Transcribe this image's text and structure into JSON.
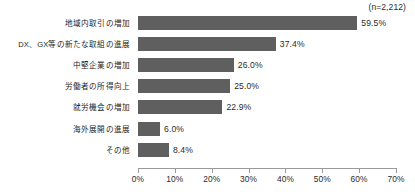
{
  "chart_data": {
    "type": "bar",
    "orientation": "horizontal",
    "title": "",
    "subtitle": "",
    "xlabel": "",
    "ylabel": "",
    "annotation": "(n=2,212)",
    "grid": false,
    "legend": false,
    "xlim": [
      0,
      70
    ],
    "xtick_labels": [
      "0%",
      "10%",
      "20%",
      "30%",
      "40%",
      "50%",
      "60%",
      "70%"
    ],
    "xticks": [
      0,
      10,
      20,
      30,
      40,
      50,
      60,
      70
    ],
    "bar_color": "#5f5f5f",
    "axis_color": "#9a9a9a",
    "categories": [
      "地域内取引の増加",
      "DX、GX等の新たな取組の進展",
      "中堅企業の増加",
      "労働者の所得向上",
      "就労機会の増加",
      "海外展開の進展",
      "その他"
    ],
    "values": [
      59.5,
      37.4,
      26.0,
      25.0,
      22.9,
      6.0,
      8.4
    ],
    "value_labels": [
      "59.5%",
      "37.4%",
      "26.0%",
      "25.0%",
      "22.9%",
      "6.0%",
      "8.4%"
    ]
  }
}
